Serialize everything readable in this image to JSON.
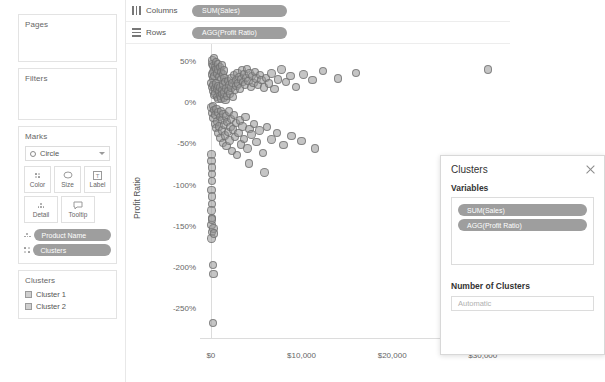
{
  "left_panel": {
    "pages": {
      "title": "Pages"
    },
    "filters": {
      "title": "Filters"
    },
    "marks": {
      "title": "Marks",
      "mark_type": "Circle",
      "buttons": [
        {
          "label": "Color",
          "icon": "color-squares-icon"
        },
        {
          "label": "Size",
          "icon": "size-icon"
        },
        {
          "label": "Label",
          "icon": "label-icon"
        },
        {
          "label": "Detail",
          "icon": "detail-icon"
        },
        {
          "label": "Tooltip",
          "icon": "tooltip-icon"
        }
      ],
      "pills": [
        {
          "label": "Product Name",
          "icon": "detail-icon"
        },
        {
          "label": "Clusters",
          "icon": "color-squares-icon"
        }
      ]
    },
    "legend": {
      "title": "Clusters",
      "items": [
        {
          "label": "Cluster 1",
          "color": "#cfcfcf"
        },
        {
          "label": "Cluster 2",
          "color": "#cfcfcf"
        }
      ]
    }
  },
  "shelves": [
    {
      "name": "columns",
      "label": "Columns",
      "pill": "SUM(Sales)",
      "icon": "columns-icon"
    },
    {
      "name": "rows",
      "label": "Rows",
      "pill": "AGG(Profit Ratio)",
      "icon": "rows-icon"
    }
  ],
  "dialog": {
    "title": "Clusters",
    "close_icon": "close-icon",
    "variables_label": "Variables",
    "variables": [
      "SUM(Sales)",
      "AGG(Profit Ratio)"
    ],
    "number_of_clusters_label": "Number of Clusters",
    "number_of_clusters_placeholder": "Automatic",
    "number_of_clusters_value": ""
  },
  "colors": {
    "pill": "#9e9e9e",
    "mark_fill": "rgba(150,150,150,.55)",
    "mark_stroke": "rgba(110,110,110,.75)",
    "axis": "#dcdcdc"
  },
  "chart_data": {
    "type": "scatter",
    "title": "",
    "xlabel": "",
    "ylabel": "Profit Ratio",
    "xticks": [
      "$0",
      "$10,000",
      "$20,000",
      "$30,000"
    ],
    "xtick_values": [
      0,
      10000,
      20000,
      30000
    ],
    "yticks": [
      "50%",
      "0%",
      "-50%",
      "-100%",
      "-150%",
      "-200%",
      "-250%"
    ],
    "ytick_values": [
      50,
      0,
      -50,
      -100,
      -150,
      -200,
      -250
    ],
    "xlim": [
      -1200,
      33000
    ],
    "ylim": [
      -285,
      72
    ],
    "grid": false,
    "legend_position": "left-panel",
    "series": [
      {
        "name": "Clusters",
        "color": "#969696",
        "points": [
          [
            120,
            48
          ],
          [
            180,
            52
          ],
          [
            260,
            45
          ],
          [
            330,
            55
          ],
          [
            420,
            40
          ],
          [
            150,
            35
          ],
          [
            240,
            30
          ],
          [
            310,
            38
          ],
          [
            390,
            33
          ],
          [
            470,
            44
          ],
          [
            550,
            50
          ],
          [
            620,
            42
          ],
          [
            700,
            36
          ],
          [
            780,
            47
          ],
          [
            860,
            41
          ],
          [
            940,
            32
          ],
          [
            1020,
            44
          ],
          [
            1100,
            38
          ],
          [
            1180,
            29
          ],
          [
            1260,
            46
          ],
          [
            1340,
            35
          ],
          [
            1420,
            40
          ],
          [
            1500,
            31
          ],
          [
            90,
            25
          ],
          [
            160,
            20
          ],
          [
            230,
            15
          ],
          [
            300,
            22
          ],
          [
            370,
            10
          ],
          [
            440,
            18
          ],
          [
            510,
            12
          ],
          [
            580,
            24
          ],
          [
            650,
            8
          ],
          [
            720,
            17
          ],
          [
            790,
            5
          ],
          [
            860,
            21
          ],
          [
            930,
            14
          ],
          [
            1000,
            9
          ],
          [
            1070,
            19
          ],
          [
            1140,
            6
          ],
          [
            1210,
            16
          ],
          [
            1280,
            11
          ],
          [
            1350,
            23
          ],
          [
            1420,
            7
          ],
          [
            1490,
            13
          ],
          [
            1560,
            26
          ],
          [
            1630,
            4
          ],
          [
            1710,
            18
          ],
          [
            1790,
            9
          ],
          [
            1870,
            27
          ],
          [
            1950,
            15
          ],
          [
            2030,
            22
          ],
          [
            2110,
            12
          ],
          [
            2200,
            30
          ],
          [
            2290,
            19
          ],
          [
            2380,
            25
          ],
          [
            2470,
            8
          ],
          [
            2560,
            34
          ],
          [
            2650,
            16
          ],
          [
            2740,
            28
          ],
          [
            2830,
            21
          ],
          [
            2920,
            37
          ],
          [
            3010,
            24
          ],
          [
            3110,
            32
          ],
          [
            3210,
            18
          ],
          [
            3310,
            29
          ],
          [
            3420,
            40
          ],
          [
            3530,
            26
          ],
          [
            3640,
            35
          ],
          [
            3760,
            23
          ],
          [
            3880,
            31
          ],
          [
            4000,
            42
          ],
          [
            4130,
            27
          ],
          [
            4260,
            36
          ],
          [
            4400,
            20
          ],
          [
            4550,
            33
          ],
          [
            4700,
            25
          ],
          [
            4860,
            38
          ],
          [
            5020,
            30
          ],
          [
            5200,
            22
          ],
          [
            5400,
            34
          ],
          [
            5600,
            28
          ],
          [
            5850,
            19
          ],
          [
            6100,
            31
          ],
          [
            6400,
            24
          ],
          [
            6700,
            36
          ],
          [
            7000,
            17
          ],
          [
            7400,
            29
          ],
          [
            7800,
            41
          ],
          [
            8300,
            26
          ],
          [
            8800,
            33
          ],
          [
            9400,
            20
          ],
          [
            10200,
            35
          ],
          [
            11200,
            28
          ],
          [
            12400,
            39
          ],
          [
            14000,
            30
          ],
          [
            16000,
            37
          ],
          [
            30600,
            41
          ],
          [
            80,
            -5
          ],
          [
            150,
            -12
          ],
          [
            220,
            -3
          ],
          [
            290,
            -18
          ],
          [
            360,
            -8
          ],
          [
            430,
            -25
          ],
          [
            500,
            -14
          ],
          [
            570,
            -30
          ],
          [
            640,
            -7
          ],
          [
            710,
            -22
          ],
          [
            780,
            -36
          ],
          [
            850,
            -11
          ],
          [
            920,
            -28
          ],
          [
            990,
            -17
          ],
          [
            1060,
            -42
          ],
          [
            1130,
            -9
          ],
          [
            1200,
            -33
          ],
          [
            1270,
            -20
          ],
          [
            1340,
            -48
          ],
          [
            1410,
            -13
          ],
          [
            1480,
            -26
          ],
          [
            1560,
            -39
          ],
          [
            1640,
            -16
          ],
          [
            1720,
            -52
          ],
          [
            1800,
            -23
          ],
          [
            1880,
            -35
          ],
          [
            1970,
            -10
          ],
          [
            2060,
            -45
          ],
          [
            2150,
            -29
          ],
          [
            2250,
            -19
          ],
          [
            2350,
            -58
          ],
          [
            2450,
            -32
          ],
          [
            2560,
            -14
          ],
          [
            2670,
            -41
          ],
          [
            2790,
            -24
          ],
          [
            2910,
            -63
          ],
          [
            3040,
            -36
          ],
          [
            3180,
            -21
          ],
          [
            3330,
            -50
          ],
          [
            3490,
            -28
          ],
          [
            3660,
            -43
          ],
          [
            3840,
            -17
          ],
          [
            4040,
            -55
          ],
          [
            4260,
            -31
          ],
          [
            4500,
            -38
          ],
          [
            4760,
            -25
          ],
          [
            5050,
            -47
          ],
          [
            5380,
            -33
          ],
          [
            5750,
            -60
          ],
          [
            6180,
            -29
          ],
          [
            6680,
            -44
          ],
          [
            7280,
            -36
          ],
          [
            8000,
            -51
          ],
          [
            8900,
            -40
          ],
          [
            10000,
            -46
          ],
          [
            11500,
            -55
          ],
          [
            4200,
            -73
          ],
          [
            5900,
            -84
          ],
          [
            60,
            -62
          ],
          [
            75,
            -70
          ],
          [
            95,
            -78
          ],
          [
            110,
            -86
          ],
          [
            130,
            -94
          ],
          [
            85,
            -105
          ],
          [
            105,
            -113
          ],
          [
            125,
            -122
          ],
          [
            70,
            -130
          ],
          [
            145,
            -139
          ],
          [
            90,
            -148
          ],
          [
            115,
            -156
          ],
          [
            80,
            -164
          ],
          [
            135,
            -141
          ],
          [
            300,
            -152
          ],
          [
            320,
            -158
          ],
          [
            250,
            -196
          ],
          [
            270,
            -207
          ],
          [
            230,
            -267
          ]
        ]
      }
    ]
  }
}
